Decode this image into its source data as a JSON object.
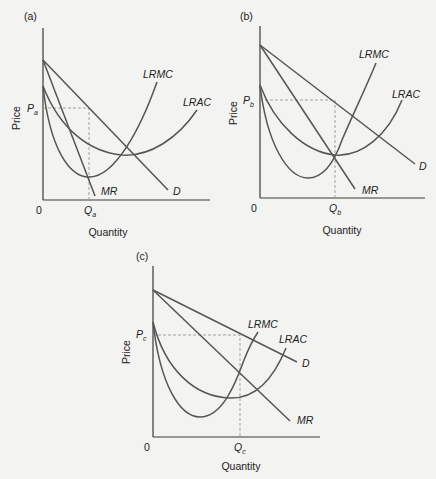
{
  "panels": [
    {
      "id": "a",
      "label": "(a)",
      "y_axis_label": "Price",
      "x_axis_label": "Quantity",
      "origin_label": "0",
      "price_label": "P",
      "price_sub": "a",
      "quantity_label": "Q",
      "quantity_sub": "a",
      "curves": {
        "lrmc": "LRMC",
        "lrac": "LRAC",
        "mr": "MR",
        "d": "D"
      }
    },
    {
      "id": "b",
      "label": "(b)",
      "y_axis_label": "Price",
      "x_axis_label": "Quantity",
      "origin_label": "0",
      "price_label": "P",
      "price_sub": "b",
      "quantity_label": "Q",
      "quantity_sub": "b",
      "curves": {
        "lrmc": "LRMC",
        "lrac": "LRAC",
        "mr": "MR",
        "d": "D"
      }
    },
    {
      "id": "c",
      "label": "(c)",
      "y_axis_label": "Price",
      "x_axis_label": "Quantity",
      "origin_label": "0",
      "price_label": "P",
      "price_sub": "c",
      "quantity_label": "Q",
      "quantity_sub": "c",
      "curves": {
        "lrmc": "LRMC",
        "lrac": "LRAC",
        "mr": "MR",
        "d": "D"
      }
    }
  ],
  "colors": {
    "background": "#f3f3f1",
    "curve": "#555555",
    "axis": "#3a3a3a",
    "dashed": "#9a9a9a"
  }
}
